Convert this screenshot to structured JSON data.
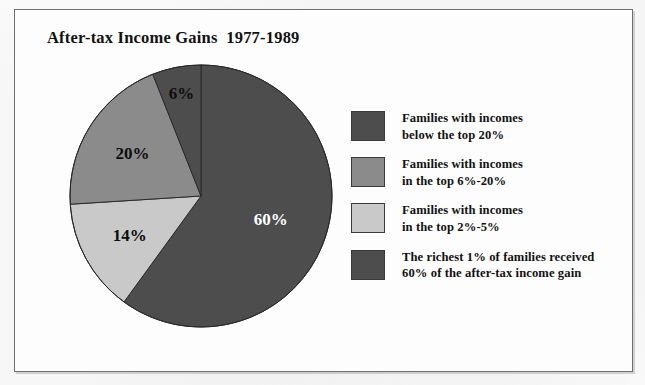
{
  "figure": {
    "title": "After-tax Income Gains  1977-1989"
  },
  "chart_data": {
    "type": "pie",
    "title": "After-tax Income Gains  1977-1989",
    "xlabel": "",
    "ylabel": "",
    "legend_position": "right",
    "grid": false,
    "units": "percent",
    "start_angle_deg": 90,
    "direction": "clockwise",
    "categories": [
      "Families with incomes below the top 20%",
      "Families with incomes in the top 6%-20%",
      "Families with incomes in the top 2%-5%",
      "The richest 1% of families received 60% of the after-tax income gain"
    ],
    "values": [
      20,
      14,
      6,
      60
    ],
    "slices": [
      {
        "label": "60%",
        "value": 60,
        "color": "#4d4d4d",
        "label_color": "#ffffff",
        "legend_index": 3,
        "legend_line1": "The richest 1% of families received",
        "legend_line2": "60% of the after-tax income gain"
      },
      {
        "label": "14%",
        "value": 14,
        "color": "#c9c9c9",
        "label_color": "#0d0d0d",
        "legend_index": 2,
        "legend_line1": "Families with incomes",
        "legend_line2": "in the top 2%-5%"
      },
      {
        "label": "20%",
        "value": 20,
        "color": "#8b8b8b",
        "label_color": "#0d0d0d",
        "legend_index": 1,
        "legend_line1": "Families with incomes",
        "legend_line2": "in the top 6%-20%"
      },
      {
        "label": "6%",
        "value": 6,
        "color": "#4d4d4d",
        "label_color": "#0d0d0d",
        "legend_index": 0,
        "legend_line1": "Families with incomes",
        "legend_line2": "below the top 20%"
      }
    ]
  },
  "legend": {
    "items": [
      {
        "swatch_color": "#4d4d4d",
        "line1": "Families with incomes",
        "line2": "below the top 20%"
      },
      {
        "swatch_color": "#8b8b8b",
        "line1": "Families with incomes",
        "line2": "in the top 6%-20%"
      },
      {
        "swatch_color": "#c9c9c9",
        "line1": "Families with incomes",
        "line2": "in the top 2%-5%"
      },
      {
        "swatch_color": "#4d4d4d",
        "line1": "The richest 1% of families received",
        "line2": "60% of the after-tax income gain"
      }
    ]
  },
  "colors": {
    "dark": "#4d4d4d",
    "medium": "#8b8b8b",
    "light": "#c9c9c9",
    "frame": "#6f6f6f",
    "text": "#111111",
    "paper": "#fbfbfb"
  }
}
